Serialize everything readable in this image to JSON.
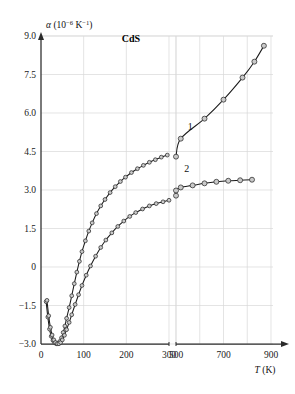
{
  "chart_data": {
    "type": "line",
    "title": "",
    "sample_label": "CdS",
    "xlabel": "T (K)",
    "ylabel": "α (10−6 K−1)",
    "ylabel_parts": {
      "symbol": "α",
      "open": " (10",
      "exp1": "−6",
      "mid": " K",
      "exp2": "−1",
      "close": ")"
    },
    "xlim": [
      0,
      900
    ],
    "ylim": [
      -3.0,
      9.0
    ],
    "grid": true,
    "axis_break": {
      "present": true,
      "between": [
        300,
        500
      ],
      "at_x_value": 380
    },
    "xticks": [
      0,
      100,
      200,
      300,
      500,
      700,
      900
    ],
    "xtick_labels": [
      "0",
      "100",
      "200",
      "300",
      "500",
      "700",
      "900"
    ],
    "yticks": [
      9.0,
      7.5,
      6.0,
      4.5,
      3.0,
      1.5,
      0,
      -1.5,
      -3.0
    ],
    "ytick_labels": [
      "9.0",
      "7.5",
      "6.0",
      "4.5",
      "3.0",
      "1.5",
      "0",
      "−1.5",
      "−3.0"
    ],
    "marker": "open-circle",
    "series": [
      {
        "name": "1",
        "label": "1",
        "label_position": {
          "T": 560,
          "alpha": 5.35
        },
        "points": [
          {
            "T": 12,
            "alpha": -1.35
          },
          {
            "T": 16,
            "alpha": -1.95
          },
          {
            "T": 20,
            "alpha": -2.42
          },
          {
            "T": 24,
            "alpha": -2.7
          },
          {
            "T": 28,
            "alpha": -2.86
          },
          {
            "T": 32,
            "alpha": -2.95
          },
          {
            "T": 36,
            "alpha": -2.99
          },
          {
            "T": 40,
            "alpha": -2.98
          },
          {
            "T": 44,
            "alpha": -2.9
          },
          {
            "T": 48,
            "alpha": -2.76
          },
          {
            "T": 52,
            "alpha": -2.55
          },
          {
            "T": 56,
            "alpha": -2.3
          },
          {
            "T": 60,
            "alpha": -2.0
          },
          {
            "T": 66,
            "alpha": -1.58
          },
          {
            "T": 72,
            "alpha": -1.12
          },
          {
            "T": 78,
            "alpha": -0.65
          },
          {
            "T": 84,
            "alpha": -0.2
          },
          {
            "T": 90,
            "alpha": 0.22
          },
          {
            "T": 96,
            "alpha": 0.6
          },
          {
            "T": 104,
            "alpha": 1.02
          },
          {
            "T": 112,
            "alpha": 1.4
          },
          {
            "T": 120,
            "alpha": 1.72
          },
          {
            "T": 130,
            "alpha": 2.08
          },
          {
            "T": 140,
            "alpha": 2.38
          },
          {
            "T": 150,
            "alpha": 2.63
          },
          {
            "T": 162,
            "alpha": 2.9
          },
          {
            "T": 174,
            "alpha": 3.13
          },
          {
            "T": 186,
            "alpha": 3.33
          },
          {
            "T": 198,
            "alpha": 3.5
          },
          {
            "T": 212,
            "alpha": 3.68
          },
          {
            "T": 226,
            "alpha": 3.83
          },
          {
            "T": 240,
            "alpha": 3.96
          },
          {
            "T": 254,
            "alpha": 4.08
          },
          {
            "T": 268,
            "alpha": 4.18
          },
          {
            "T": 282,
            "alpha": 4.28
          },
          {
            "T": 296,
            "alpha": 4.36
          },
          {
            "T": 420,
            "alpha": 4.3
          },
          {
            "T": 520,
            "alpha": 5.0
          },
          {
            "T": 620,
            "alpha": 5.78
          },
          {
            "T": 700,
            "alpha": 6.52
          },
          {
            "T": 780,
            "alpha": 7.38
          },
          {
            "T": 830,
            "alpha": 8.0
          },
          {
            "T": 870,
            "alpha": 8.62
          }
        ]
      },
      {
        "name": "2",
        "label": "2",
        "label_position": {
          "T": 545,
          "alpha": 3.72
        },
        "points": [
          {
            "T": 14,
            "alpha": -1.3
          },
          {
            "T": 18,
            "alpha": -1.9
          },
          {
            "T": 22,
            "alpha": -2.35
          },
          {
            "T": 26,
            "alpha": -2.65
          },
          {
            "T": 30,
            "alpha": -2.84
          },
          {
            "T": 34,
            "alpha": -2.94
          },
          {
            "T": 38,
            "alpha": -2.99
          },
          {
            "T": 42,
            "alpha": -2.99
          },
          {
            "T": 46,
            "alpha": -2.94
          },
          {
            "T": 50,
            "alpha": -2.84
          },
          {
            "T": 55,
            "alpha": -2.66
          },
          {
            "T": 60,
            "alpha": -2.44
          },
          {
            "T": 66,
            "alpha": -2.16
          },
          {
            "T": 72,
            "alpha": -1.86
          },
          {
            "T": 80,
            "alpha": -1.46
          },
          {
            "T": 88,
            "alpha": -1.08
          },
          {
            "T": 96,
            "alpha": -0.72
          },
          {
            "T": 106,
            "alpha": -0.32
          },
          {
            "T": 116,
            "alpha": 0.04
          },
          {
            "T": 128,
            "alpha": 0.42
          },
          {
            "T": 140,
            "alpha": 0.76
          },
          {
            "T": 152,
            "alpha": 1.05
          },
          {
            "T": 166,
            "alpha": 1.33
          },
          {
            "T": 180,
            "alpha": 1.58
          },
          {
            "T": 194,
            "alpha": 1.79
          },
          {
            "T": 208,
            "alpha": 1.97
          },
          {
            "T": 222,
            "alpha": 2.12
          },
          {
            "T": 238,
            "alpha": 2.26
          },
          {
            "T": 254,
            "alpha": 2.38
          },
          {
            "T": 270,
            "alpha": 2.47
          },
          {
            "T": 286,
            "alpha": 2.54
          },
          {
            "T": 300,
            "alpha": 2.6
          },
          {
            "T": 420,
            "alpha": 2.78
          },
          {
            "T": 470,
            "alpha": 2.98
          },
          {
            "T": 520,
            "alpha": 3.1
          },
          {
            "T": 570,
            "alpha": 3.18
          },
          {
            "T": 620,
            "alpha": 3.26
          },
          {
            "T": 670,
            "alpha": 3.32
          },
          {
            "T": 720,
            "alpha": 3.36
          },
          {
            "T": 770,
            "alpha": 3.38
          },
          {
            "T": 820,
            "alpha": 3.4
          }
        ]
      }
    ]
  },
  "colors": {
    "axis": "#2b2b2b",
    "grid": "#d9d9d9",
    "curve": "#1a1a1a",
    "marker_fill": "#c9c9c9",
    "marker_stroke": "#2b2b2b",
    "background": "#ffffff"
  }
}
